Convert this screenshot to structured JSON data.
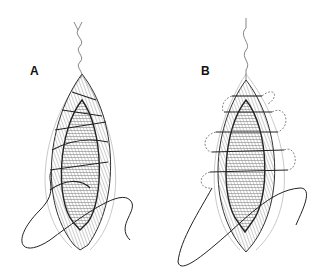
{
  "figure": {
    "panels": [
      {
        "label": "A",
        "description": "Wound closure with continuous running suture, oblique loops"
      },
      {
        "label": "B",
        "description": "Wound closure with continuous suture, horizontal loops extending outside wound edge"
      }
    ],
    "colors": {
      "line": "#222222",
      "hatch": "#777777",
      "background": "#ffffff",
      "thread": "#555555"
    }
  }
}
